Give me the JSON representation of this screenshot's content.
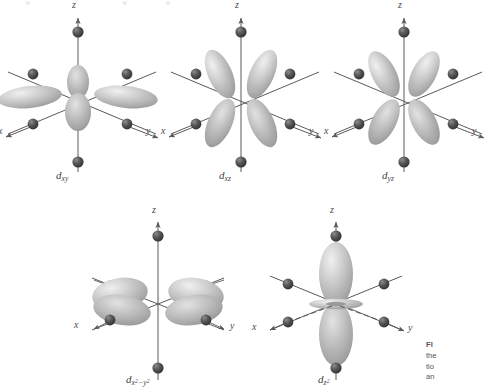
{
  "figure": {
    "background_color": "#ffffff",
    "lobe_color": "#b9b9b9",
    "lobe_highlight_color": "#e4e4e4",
    "ligand_color": "#4a4a4a",
    "axis_color": "#5a5a5a",
    "label_color": "#4a4a4a"
  },
  "bleed_text": {
    "left": "●",
    "mid": "●",
    "right": "●"
  },
  "caption": {
    "line1": "Fl",
    "line2": "the",
    "line3": "tio",
    "line4": "an"
  },
  "axes": {
    "z": "z",
    "x": "x",
    "y": "y"
  },
  "orbitals": [
    {
      "id": "dxy",
      "name": "d",
      "sub": "xy",
      "sub_sup": "",
      "axis_z": "z",
      "axis_x": "x",
      "axis_y": "y",
      "lobe_style": "in-plane-four",
      "row": 1,
      "col": 1
    },
    {
      "id": "dxz",
      "name": "d",
      "sub": "xz",
      "sub_sup": "",
      "axis_z": "z",
      "axis_x": "x",
      "axis_y": "y",
      "lobe_style": "tilted-four",
      "row": 1,
      "col": 2
    },
    {
      "id": "dyz",
      "name": "d",
      "sub": "yz",
      "sub_sup": "",
      "axis_z": "z",
      "axis_x": "x",
      "axis_y": "y",
      "lobe_style": "tilted-four",
      "row": 1,
      "col": 3
    },
    {
      "id": "dx2y2",
      "name": "d",
      "sub": "x2−y2",
      "sub_sup": "2",
      "axis_z": "z",
      "axis_x": "x",
      "axis_y": "y",
      "lobe_style": "along-axis-four",
      "row": 2,
      "col": 1
    },
    {
      "id": "dz2",
      "name": "d",
      "sub": "z2",
      "sub_sup": "2",
      "axis_z": "z",
      "axis_x": "x",
      "axis_y": "y",
      "lobe_style": "dumbbell-torus",
      "row": 2,
      "col": 2
    }
  ],
  "ligand_count_per_diagram": 6
}
